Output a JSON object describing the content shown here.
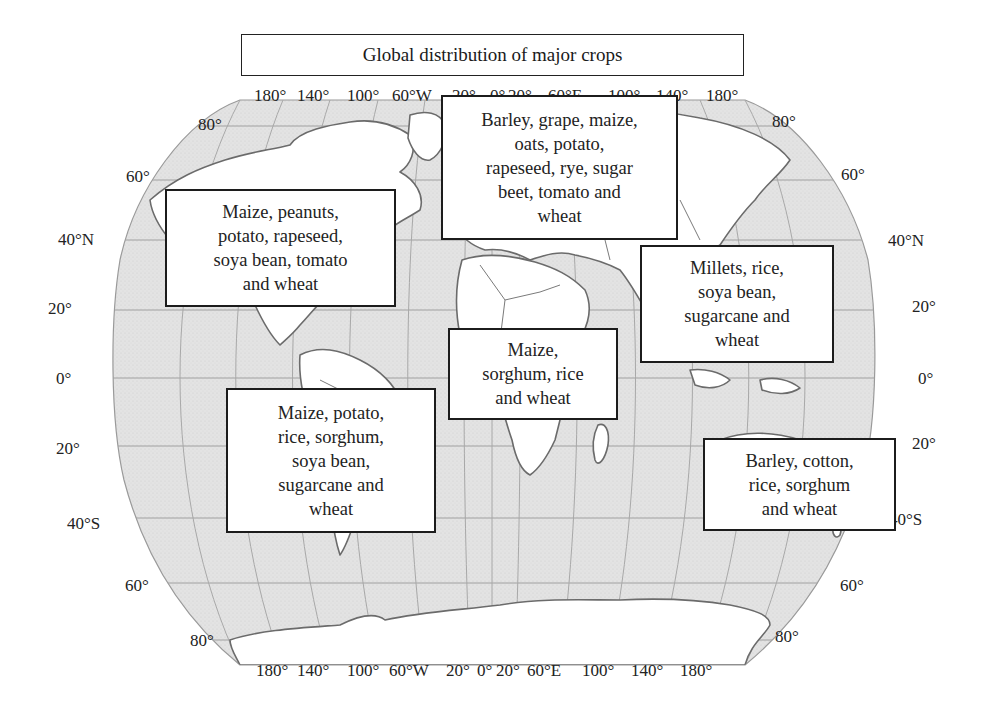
{
  "title": "Global distribution of major crops",
  "colors": {
    "ocean": "#e2e2e2",
    "land": "#ffffff",
    "border": "#6b6b6b",
    "grid": "#9a9a9a",
    "box_border": "#1c1c1c"
  },
  "top_longitude_labels": [
    "180°",
    "140°",
    "100°",
    "60°W",
    "20°",
    "0°",
    "20°",
    "60°E",
    "100°",
    "140°",
    "180°"
  ],
  "bottom_longitude_labels": [
    "180°",
    "140°",
    "100°",
    "60°W",
    "20°",
    "0°",
    "20°",
    "60°E",
    "100°",
    "140°",
    "180°"
  ],
  "left_latitude_labels": [
    "80°",
    "60°",
    "40°N",
    "20°",
    "0°",
    "20°",
    "40°S",
    "60°",
    "80°"
  ],
  "right_latitude_labels": [
    "80°",
    "60°",
    "40°N",
    "20°",
    "0°",
    "20°",
    "40°S",
    "60°",
    "80°"
  ],
  "regions": [
    {
      "id": "north-america",
      "lines": [
        "Maize, peanuts,",
        "potato, rapeseed,",
        "soya bean, tomato",
        "and wheat"
      ]
    },
    {
      "id": "europe",
      "lines": [
        "Barley, grape, maize,",
        "oats, potato,",
        "rapeseed, rye, sugar",
        "beet, tomato and",
        "wheat"
      ]
    },
    {
      "id": "asia",
      "lines": [
        "Millets, rice,",
        "soya bean,",
        "sugarcane and",
        "wheat"
      ]
    },
    {
      "id": "africa",
      "lines": [
        "Maize,",
        "sorghum, rice",
        "and wheat"
      ]
    },
    {
      "id": "south-america",
      "lines": [
        "Maize, potato,",
        "rice, sorghum,",
        "soya bean,",
        "sugarcane and",
        "wheat"
      ]
    },
    {
      "id": "oceania",
      "lines": [
        "Barley, cotton,",
        "rice, sorghum",
        "and wheat"
      ]
    }
  ]
}
